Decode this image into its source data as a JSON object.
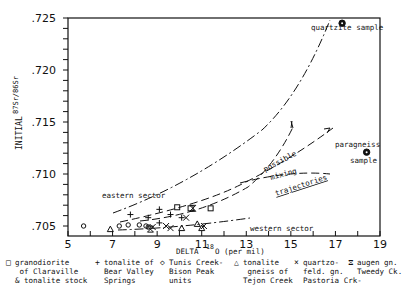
{
  "chart_data": {
    "type": "scatter",
    "title": "",
    "xlabel": "DELTA 18O (per mil)",
    "ylabel": "INITIAL 87Sr/86Sr",
    "xlim": [
      5,
      19
    ],
    "ylim": [
      0.704,
      0.725
    ],
    "x_ticks": [
      "5",
      "7",
      "9",
      "11",
      "13",
      "15",
      "17",
      "19"
    ],
    "y_ticks": [
      ".705",
      ".710",
      ".715",
      ".720",
      ".725"
    ],
    "grid": false,
    "legend_position": "bottom",
    "series": [
      {
        "name": "granodiorite of Claraville & tonalite stock",
        "symbol": "square",
        "points": [
          [
            9.9,
            0.7068
          ],
          [
            10.5,
            0.7067
          ],
          [
            11.4,
            0.7067
          ]
        ]
      },
      {
        "name": "tonalite of Bear Valley Springs",
        "symbol": "plus",
        "points": [
          [
            7.8,
            0.7061
          ],
          [
            8.6,
            0.7058
          ],
          [
            9.1,
            0.7066
          ],
          [
            9.1,
            0.7053
          ],
          [
            9.6,
            0.7061
          ],
          [
            10.1,
            0.7058
          ]
        ]
      },
      {
        "name": "Tunis Creek-Bison Peak units",
        "symbol": "diamond",
        "points": [
          [
            5.7,
            0.705
          ],
          [
            7.3,
            0.705
          ],
          [
            7.7,
            0.7051
          ],
          [
            8.2,
            0.7051
          ],
          [
            8.5,
            0.705
          ],
          [
            8.6,
            0.7049
          ]
        ]
      },
      {
        "name": "tonalite gneiss of Tejon Creek",
        "symbol": "triangle",
        "points": [
          [
            6.9,
            0.7047
          ],
          [
            10.1,
            0.7048
          ],
          [
            10.8,
            0.7052
          ],
          [
            11.0,
            0.7048
          ]
        ]
      },
      {
        "name": "quartzo-feld. gn. Pastoria Crk-",
        "symbol": "x",
        "points": [
          [
            8.8,
            0.7049
          ],
          [
            9.4,
            0.705
          ],
          [
            9.6,
            0.7048
          ],
          [
            10.3,
            0.7058
          ],
          [
            11.1,
            0.705
          ]
        ]
      },
      {
        "name": "augen gn. Tweedy Ck.",
        "symbol": "hourglass",
        "points": [
          [
            8.7,
            0.7047
          ],
          [
            10.6,
            0.7067
          ]
        ]
      },
      {
        "name": "quartzite sample",
        "symbol": "filled-circle",
        "points": [
          [
            17.3,
            0.7245
          ]
        ]
      },
      {
        "name": "paragneiss sample",
        "symbol": "filled-circle",
        "points": [
          [
            18.4,
            0.7121
          ]
        ]
      }
    ],
    "annotations": [
      "eastern sector",
      "western sector",
      "possible mixing trajectories",
      "quartzite sample",
      "paragneiss sample"
    ]
  },
  "axes": {
    "y_label_prefix": "INITIAL",
    "y_label_ratio": "87Sr/86Sr",
    "x_label_main": "DELTA",
    "x_label_sup": "18",
    "x_label_rest": "O (per mil)"
  },
  "annotations": {
    "quartzite": "quartzite sample",
    "paragneiss_1": "paragneiss",
    "paragneiss_2": "sample",
    "eastern": "eastern sector",
    "western": "western sector",
    "possible": "possible",
    "mixing": "mixing",
    "trajectories": "trajectories"
  },
  "legend": [
    {
      "symbol": "□",
      "text": "granodiorite\n of Claraville\n& tonalite stock"
    },
    {
      "symbol": "+",
      "text": "tonalite of\nBear Valley\nSprings"
    },
    {
      "symbol": "◇",
      "text": "Tunis Creek-\nBison Peak\nunits"
    },
    {
      "symbol": "△",
      "text": "tonalite\n gneiss of\nTejon Creek"
    },
    {
      "symbol": "×",
      "text": "quartzo-\nfeld. gn.\nPastoria Crk-"
    },
    {
      "symbol": "⧖",
      "text": "augen gn.\nTweedy Ck."
    }
  ]
}
